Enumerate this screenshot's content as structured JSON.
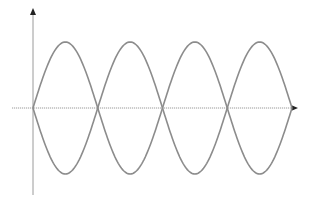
{
  "diagram": {
    "type": "wave-diagram",
    "colors": {
      "background": "#ffffff",
      "axis": "#9a9a9a",
      "axis_arrow": "#222222",
      "wave": "#8c8c8c"
    },
    "axes": {
      "origin_x": 33,
      "baseline_y": 108,
      "x_axis": {
        "x_start": 12,
        "x_end": 298,
        "arrow": "right"
      },
      "y_axis": {
        "y_start": 195,
        "y_end": 8,
        "arrow": "up"
      }
    },
    "waves": [
      {
        "name": "sine-wave",
        "phase": 1,
        "amplitude": 66,
        "half_periods": 4,
        "start_x": 33,
        "end_x": 292
      },
      {
        "name": "inverted-sine-wave",
        "phase": -1,
        "amplitude": 66,
        "half_periods": 4,
        "start_x": 33,
        "end_x": 292
      }
    ],
    "zero_crossings_x": [
      33,
      98,
      163,
      228,
      292
    ],
    "peaks_y": 42,
    "troughs_y": 174
  }
}
